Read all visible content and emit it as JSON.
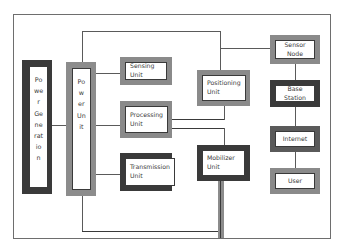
{
  "diagram": {
    "nodes": {
      "power_generation": {
        "label": "Power Generation",
        "lines": [
          "Po",
          "we",
          "r",
          "Ge",
          "ne",
          "rat",
          "io",
          "n"
        ]
      },
      "power_unit": {
        "label": "Power Unit",
        "lines": [
          "Po",
          "w",
          "er",
          "Un",
          "it"
        ]
      },
      "sensing_unit": {
        "label": "Sensing Unit"
      },
      "processing_unit": {
        "label": "Processing Unit",
        "line1": "Processing",
        "line2": "Unit"
      },
      "transmission_unit": {
        "label": "Transmission Unit",
        "line1": "Transmission",
        "line2": "Unit"
      },
      "positioning_unit": {
        "label": "Positioning Unit",
        "line1": "Positioning",
        "line2": "Unit"
      },
      "mobilizer_unit": {
        "label": "Mobilizer Unit",
        "line1": "Mobilizer",
        "line2": "Unit"
      },
      "sensor_node": {
        "label": "Sensor Node"
      },
      "base_station": {
        "label": "Base Station"
      },
      "internet": {
        "label": "Internet"
      },
      "user": {
        "label": "User"
      }
    },
    "edges": [
      [
        "Power Generation",
        "Power Unit"
      ],
      [
        "Power Unit",
        "Sensing Unit"
      ],
      [
        "Power Unit",
        "Processing Unit"
      ],
      [
        "Power Unit",
        "Transmission Unit"
      ],
      [
        "Power Unit",
        "Positioning Unit"
      ],
      [
        "Power Unit",
        "Sensor Node"
      ],
      [
        "Processing Unit",
        "Positioning Unit"
      ],
      [
        "Processing Unit",
        "Mobilizer Unit"
      ],
      [
        "Mobilizer Unit",
        "Power Unit"
      ],
      [
        "Sensor Node",
        "Base Station"
      ],
      [
        "Base Station",
        "Internet"
      ],
      [
        "Internet",
        "User"
      ]
    ],
    "colors": {
      "dark_border": "#3a3a3a",
      "gray_border": "#8a8a8a",
      "line": "#5a5a5a"
    }
  }
}
